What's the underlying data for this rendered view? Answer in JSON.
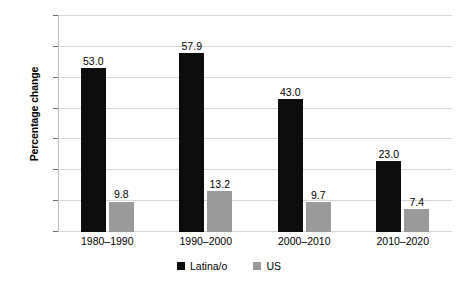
{
  "chart_data": {
    "type": "bar",
    "title": "",
    "subtitle": "",
    "xlabel": "",
    "ylabel": "Percentage change",
    "categories": [
      "1980–1990",
      "1990–2000",
      "2000–2010",
      "2010–2020"
    ],
    "series": [
      {
        "name": "Latina/o",
        "color": "#0d0d0d",
        "values": [
          53.0,
          57.9,
          43.0,
          23.0
        ],
        "labels": [
          "53.0",
          "57.9",
          "43.0",
          "23.0"
        ]
      },
      {
        "name": "US",
        "color": "#9a9a9a",
        "values": [
          9.8,
          13.2,
          9.7,
          7.4
        ],
        "labels": [
          "9.8",
          "13.2",
          "9.7",
          "7.4"
        ]
      }
    ],
    "ylim": [
      0.0,
      70.0
    ],
    "yticks": [
      0.0,
      10.0,
      20.0,
      30.0,
      40.0,
      50.0,
      60.0,
      70.0
    ],
    "ytick_labels": [
      "0.0",
      "10.0",
      "20.0",
      "30.0",
      "40.0",
      "50.0",
      "60.0",
      "70.0"
    ],
    "grid": true,
    "legend_position": "bottom",
    "legend_entries": [
      "Latina/o",
      "US"
    ]
  },
  "colors": {
    "series_latina": "#0d0d0d",
    "series_us": "#9a9a9a",
    "gridline": "#d6d6d6",
    "axis": "#6e6e6e",
    "background": "#ffffff",
    "text": "#000000"
  }
}
